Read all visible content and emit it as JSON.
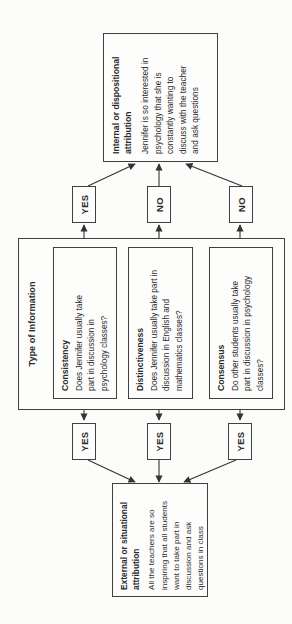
{
  "diagram": {
    "toi": {
      "title": "Type of Information",
      "items": [
        {
          "title": "Consistency",
          "question": "Does Jennifer usually take\npart in discussion in\npsychology classes?"
        },
        {
          "title": "Distinctiveness",
          "question": "Does Jennifer usually take part in\ndiscussion in English and\nmathematics classes?"
        },
        {
          "title": "Consensus",
          "question": "Do other students usually take\npart in discussion in psychology\nclasses?"
        }
      ]
    },
    "answers": {
      "left": [
        "YES",
        "YES",
        "YES"
      ],
      "right": [
        "YES",
        "NO",
        "NO"
      ]
    },
    "external": {
      "title": "External or situational\nattribution",
      "body": "All the teachers are so\ninspiring that all students\nwant to take part in\ndiscussion and ask\nquestions in class"
    },
    "internal": {
      "title": "Internal or dispositional\nattribution",
      "body": "Jennifer is so interested in\npsychology that she is\nconstantly wanting to\ndiscuss with the teacher\nand ask questions"
    },
    "edges": [
      {
        "from": "Consistency",
        "answer": "YES",
        "to": "External or situational attribution"
      },
      {
        "from": "Distinctiveness",
        "answer": "YES",
        "to": "External or situational attribution"
      },
      {
        "from": "Consensus",
        "answer": "YES",
        "to": "External or situational attribution"
      },
      {
        "from": "Consistency",
        "answer": "YES",
        "to": "Internal or dispositional attribution"
      },
      {
        "from": "Distinctiveness",
        "answer": "NO",
        "to": "Internal or dispositional attribution"
      },
      {
        "from": "Consensus",
        "answer": "NO",
        "to": "Internal or dispositional attribution"
      }
    ],
    "orientation": "rotated-90-ccw",
    "colors": {
      "background": "#fcfcfb",
      "box_fill": "#fdfdfc",
      "border": "#404040",
      "line": "#333333",
      "text": "#2b2b2b"
    }
  }
}
